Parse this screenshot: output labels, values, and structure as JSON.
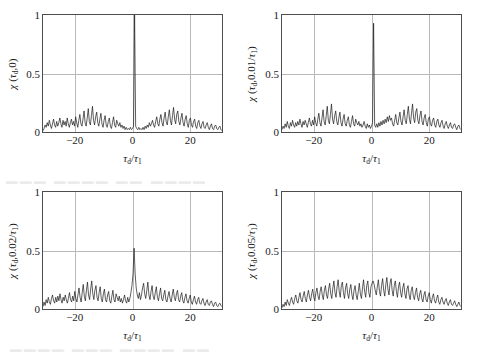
{
  "figure": {
    "background_color": "#ffffff",
    "frame_color": "#4d4d4d",
    "grid_color": "#b9b9b9",
    "curve_color": "#1a1a1a"
  },
  "chart_data": [
    {
      "type": "line",
      "panel": "top-left",
      "title": "",
      "xlabel": "τd/τ1",
      "ylabel": "χ (τd,0)",
      "ylabel_parts": {
        "chi": "χ",
        "open": "(",
        "tau": "τ",
        "sub": "d",
        "mid": ",0",
        "close": ")"
      },
      "doppler_offset": "0",
      "xlim": [
        -31,
        31
      ],
      "ylim": [
        0,
        1
      ],
      "xticks": [
        -20,
        0,
        20
      ],
      "xticklabels": [
        "−20",
        "0",
        "20"
      ],
      "yticks": [
        0,
        0.5,
        1
      ],
      "yticklabels": [
        "0",
        "0.5",
        "1"
      ],
      "grid": true,
      "gridlines_v": [
        -20,
        0,
        20
      ],
      "gridlines_h": [
        0.5
      ],
      "peak": {
        "x": 0,
        "y": 1.0
      },
      "sidelobe_max": 0.22,
      "sidelobe_mean": 0.09,
      "values": [
        0.01,
        0.03,
        0.06,
        0.04,
        0.08,
        0.05,
        0.1,
        0.06,
        0.03,
        0.07,
        0.11,
        0.06,
        0.04,
        0.09,
        0.05,
        0.08,
        0.12,
        0.07,
        0.04,
        0.1,
        0.06,
        0.09,
        0.05,
        0.12,
        0.07,
        0.04,
        0.08,
        0.11,
        0.06,
        0.09,
        0.05,
        0.13,
        0.08,
        0.04,
        0.1,
        0.15,
        0.07,
        0.05,
        0.11,
        0.18,
        0.08,
        0.05,
        0.12,
        0.2,
        0.09,
        0.06,
        0.14,
        0.22,
        0.1,
        0.06,
        0.13,
        0.17,
        0.08,
        0.05,
        0.11,
        0.16,
        0.07,
        0.04,
        0.1,
        0.14,
        0.06,
        0.04,
        0.09,
        0.12,
        0.05,
        0.03,
        0.08,
        0.13,
        0.06,
        0.04,
        0.1,
        0.07,
        0.05,
        0.08,
        0.04,
        0.06,
        0.03,
        0.05,
        0.02,
        0.04,
        0.02,
        0.03,
        0.02,
        0.04,
        0.02,
        0.03,
        0.05,
        1.0,
        0.05,
        0.03,
        0.02,
        0.04,
        0.02,
        0.03,
        0.02,
        0.04,
        0.02,
        0.05,
        0.03,
        0.06,
        0.04,
        0.08,
        0.05,
        0.07,
        0.1,
        0.06,
        0.04,
        0.09,
        0.13,
        0.07,
        0.05,
        0.11,
        0.15,
        0.08,
        0.05,
        0.12,
        0.17,
        0.09,
        0.06,
        0.13,
        0.19,
        0.1,
        0.06,
        0.14,
        0.21,
        0.11,
        0.07,
        0.15,
        0.18,
        0.09,
        0.06,
        0.12,
        0.16,
        0.08,
        0.05,
        0.11,
        0.14,
        0.07,
        0.04,
        0.1,
        0.12,
        0.06,
        0.04,
        0.09,
        0.11,
        0.05,
        0.03,
        0.08,
        0.1,
        0.05,
        0.03,
        0.07,
        0.09,
        0.04,
        0.03,
        0.06,
        0.08,
        0.04,
        0.02,
        0.05,
        0.07,
        0.03,
        0.02,
        0.05,
        0.06,
        0.03,
        0.02,
        0.04,
        0.05,
        0.02,
        0.01
      ]
    },
    {
      "type": "line",
      "panel": "top-right",
      "title": "",
      "xlabel": "τd/τ1",
      "ylabel": "χ (τd,0.01/τ1)",
      "ylabel_parts": {
        "chi": "χ",
        "open": "(",
        "tau": "τ",
        "sub": "d",
        "mid": ",0.01/",
        "tau2": "τ",
        "sub2": "1",
        "close": ")"
      },
      "doppler_offset": "0.01/τ1",
      "xlim": [
        -31,
        31
      ],
      "ylim": [
        0,
        1
      ],
      "xticks": [
        -20,
        0,
        20
      ],
      "xticklabels": [
        "−20",
        "0",
        "20"
      ],
      "yticks": [
        0,
        0.5,
        1
      ],
      "yticklabels": [
        "0",
        "0.5",
        "1"
      ],
      "grid": true,
      "gridlines_v": [
        -20,
        0,
        20
      ],
      "gridlines_h": [
        0.5
      ],
      "peak": {
        "x": 0,
        "y": 0.93
      },
      "sidelobe_max": 0.25,
      "sidelobe_mean": 0.1,
      "values": [
        0.02,
        0.05,
        0.03,
        0.07,
        0.04,
        0.09,
        0.05,
        0.03,
        0.08,
        0.05,
        0.1,
        0.06,
        0.04,
        0.08,
        0.05,
        0.09,
        0.06,
        0.11,
        0.07,
        0.04,
        0.09,
        0.06,
        0.1,
        0.07,
        0.04,
        0.08,
        0.12,
        0.07,
        0.05,
        0.1,
        0.06,
        0.13,
        0.08,
        0.05,
        0.11,
        0.16,
        0.08,
        0.05,
        0.12,
        0.19,
        0.09,
        0.06,
        0.14,
        0.22,
        0.1,
        0.07,
        0.15,
        0.24,
        0.11,
        0.07,
        0.14,
        0.18,
        0.09,
        0.06,
        0.12,
        0.17,
        0.08,
        0.05,
        0.11,
        0.15,
        0.07,
        0.05,
        0.1,
        0.13,
        0.06,
        0.04,
        0.09,
        0.14,
        0.07,
        0.05,
        0.11,
        0.08,
        0.06,
        0.09,
        0.05,
        0.07,
        0.04,
        0.06,
        0.09,
        0.05,
        0.03,
        0.07,
        0.04,
        0.06,
        0.03,
        0.05,
        0.08,
        0.93,
        0.06,
        0.04,
        0.07,
        0.04,
        0.08,
        0.05,
        0.09,
        0.06,
        0.1,
        0.07,
        0.11,
        0.08,
        0.13,
        0.09,
        0.14,
        0.1,
        0.12,
        0.07,
        0.05,
        0.1,
        0.15,
        0.08,
        0.06,
        0.12,
        0.17,
        0.09,
        0.06,
        0.13,
        0.19,
        0.1,
        0.07,
        0.15,
        0.22,
        0.11,
        0.07,
        0.16,
        0.24,
        0.12,
        0.08,
        0.17,
        0.2,
        0.1,
        0.07,
        0.14,
        0.18,
        0.09,
        0.06,
        0.12,
        0.15,
        0.08,
        0.05,
        0.11,
        0.13,
        0.07,
        0.05,
        0.1,
        0.12,
        0.06,
        0.04,
        0.09,
        0.11,
        0.06,
        0.04,
        0.08,
        0.1,
        0.05,
        0.03,
        0.07,
        0.09,
        0.05,
        0.03,
        0.06,
        0.08,
        0.04,
        0.03,
        0.06,
        0.07,
        0.04,
        0.02,
        0.05,
        0.06,
        0.03,
        0.02
      ]
    },
    {
      "type": "line",
      "panel": "bottom-left",
      "title": "",
      "xlabel": "τd/τ1",
      "ylabel": "χ (τd,0.02/τ1)",
      "ylabel_parts": {
        "chi": "χ",
        "open": "(",
        "tau": "τ",
        "sub": "d",
        "mid": ",0.02/",
        "tau2": "τ",
        "sub2": "1",
        "close": ")"
      },
      "doppler_offset": "0.02/τ1",
      "xlim": [
        -31,
        31
      ],
      "ylim": [
        0,
        1
      ],
      "xticks": [
        -20,
        0,
        20
      ],
      "xticklabels": [
        "−20",
        "0",
        "20"
      ],
      "yticks": [
        0,
        0.5,
        1
      ],
      "yticklabels": [
        "0",
        "0.5",
        "1"
      ],
      "grid": true,
      "gridlines_v": [
        -20,
        0,
        20
      ],
      "gridlines_h": [
        0.5
      ],
      "peak": {
        "x": 0,
        "y": 0.52
      },
      "sidelobe_max": 0.24,
      "sidelobe_mean": 0.11,
      "values": [
        0.02,
        0.06,
        0.03,
        0.08,
        0.05,
        0.1,
        0.06,
        0.04,
        0.09,
        0.12,
        0.07,
        0.05,
        0.1,
        0.06,
        0.11,
        0.07,
        0.13,
        0.08,
        0.05,
        0.1,
        0.07,
        0.12,
        0.08,
        0.05,
        0.09,
        0.14,
        0.08,
        0.06,
        0.11,
        0.07,
        0.15,
        0.09,
        0.06,
        0.12,
        0.18,
        0.1,
        0.06,
        0.14,
        0.21,
        0.11,
        0.07,
        0.16,
        0.23,
        0.12,
        0.08,
        0.17,
        0.24,
        0.13,
        0.08,
        0.16,
        0.2,
        0.1,
        0.07,
        0.14,
        0.19,
        0.09,
        0.06,
        0.13,
        0.17,
        0.08,
        0.06,
        0.12,
        0.15,
        0.07,
        0.05,
        0.11,
        0.16,
        0.08,
        0.06,
        0.13,
        0.1,
        0.07,
        0.11,
        0.06,
        0.09,
        0.05,
        0.08,
        0.12,
        0.07,
        0.05,
        0.1,
        0.06,
        0.09,
        0.14,
        0.2,
        0.3,
        0.52,
        0.3,
        0.18,
        0.12,
        0.09,
        0.14,
        0.08,
        0.12,
        0.18,
        0.22,
        0.13,
        0.09,
        0.16,
        0.23,
        0.12,
        0.08,
        0.15,
        0.2,
        0.11,
        0.08,
        0.14,
        0.19,
        0.1,
        0.07,
        0.13,
        0.18,
        0.09,
        0.07,
        0.12,
        0.16,
        0.08,
        0.06,
        0.11,
        0.15,
        0.09,
        0.06,
        0.12,
        0.17,
        0.1,
        0.07,
        0.13,
        0.16,
        0.08,
        0.06,
        0.11,
        0.14,
        0.07,
        0.05,
        0.1,
        0.13,
        0.07,
        0.05,
        0.09,
        0.12,
        0.06,
        0.04,
        0.08,
        0.11,
        0.06,
        0.04,
        0.08,
        0.1,
        0.05,
        0.04,
        0.07,
        0.09,
        0.05,
        0.03,
        0.06,
        0.08,
        0.04,
        0.03,
        0.06,
        0.07,
        0.04,
        0.02,
        0.05,
        0.06,
        0.03,
        0.02,
        0.04,
        0.05,
        0.03,
        0.02
      ]
    },
    {
      "type": "line",
      "panel": "bottom-right",
      "title": "",
      "xlabel": "τd/τ1",
      "ylabel": "χ (τd,0.05/τ1)",
      "ylabel_parts": {
        "chi": "χ",
        "open": "(",
        "tau": "τ",
        "sub": "d",
        "mid": ",0.05/",
        "tau2": "τ",
        "sub2": "1",
        "close": ")"
      },
      "doppler_offset": "0.05/τ1",
      "xlim": [
        -31,
        31
      ],
      "ylim": [
        0,
        1
      ],
      "xticks": [
        -20,
        0,
        20
      ],
      "xticklabels": [
        "−20",
        "0",
        "20"
      ],
      "yticks": [
        0,
        0.5,
        1
      ],
      "yticklabels": [
        "0",
        "0.5",
        "1"
      ],
      "grid": true,
      "gridlines_v": [
        -20,
        0,
        20
      ],
      "gridlines_h": [
        0.5
      ],
      "peak": {
        "x": 0,
        "y": 0.24
      },
      "sidelobe_max": 0.27,
      "sidelobe_mean": 0.13,
      "values": [
        0.01,
        0.04,
        0.02,
        0.06,
        0.03,
        0.08,
        0.05,
        0.03,
        0.07,
        0.1,
        0.06,
        0.04,
        0.09,
        0.12,
        0.07,
        0.05,
        0.1,
        0.14,
        0.08,
        0.06,
        0.11,
        0.15,
        0.09,
        0.06,
        0.12,
        0.16,
        0.1,
        0.07,
        0.13,
        0.17,
        0.1,
        0.07,
        0.14,
        0.18,
        0.11,
        0.08,
        0.15,
        0.19,
        0.12,
        0.08,
        0.16,
        0.2,
        0.12,
        0.09,
        0.17,
        0.22,
        0.13,
        0.09,
        0.18,
        0.24,
        0.14,
        0.1,
        0.19,
        0.25,
        0.15,
        0.1,
        0.2,
        0.23,
        0.14,
        0.09,
        0.18,
        0.22,
        0.13,
        0.09,
        0.17,
        0.21,
        0.12,
        0.08,
        0.16,
        0.2,
        0.12,
        0.08,
        0.15,
        0.22,
        0.13,
        0.09,
        0.18,
        0.25,
        0.15,
        0.1,
        0.2,
        0.24,
        0.14,
        0.1,
        0.19,
        0.22,
        0.24,
        0.21,
        0.16,
        0.12,
        0.19,
        0.25,
        0.15,
        0.11,
        0.2,
        0.26,
        0.16,
        0.11,
        0.21,
        0.27,
        0.17,
        0.12,
        0.22,
        0.26,
        0.16,
        0.11,
        0.2,
        0.24,
        0.15,
        0.1,
        0.19,
        0.23,
        0.14,
        0.1,
        0.18,
        0.22,
        0.13,
        0.09,
        0.17,
        0.2,
        0.12,
        0.08,
        0.16,
        0.19,
        0.11,
        0.08,
        0.14,
        0.18,
        0.1,
        0.07,
        0.13,
        0.16,
        0.09,
        0.06,
        0.12,
        0.15,
        0.08,
        0.06,
        0.11,
        0.14,
        0.08,
        0.05,
        0.1,
        0.13,
        0.07,
        0.05,
        0.09,
        0.12,
        0.06,
        0.04,
        0.08,
        0.1,
        0.06,
        0.04,
        0.07,
        0.09,
        0.05,
        0.03,
        0.06,
        0.08,
        0.04,
        0.03,
        0.05,
        0.07,
        0.04,
        0.02,
        0.04,
        0.06,
        0.03,
        0.02
      ]
    }
  ]
}
